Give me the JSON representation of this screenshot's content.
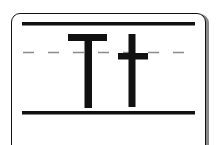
{
  "icon": {
    "name": "letter-case-tt-icon",
    "glyphs": [
      "T",
      "t"
    ],
    "colors": {
      "stroke": "#111111",
      "guide": "#8c8c8c",
      "background": "#ffffff",
      "shadow": "#8a8a8a"
    }
  }
}
